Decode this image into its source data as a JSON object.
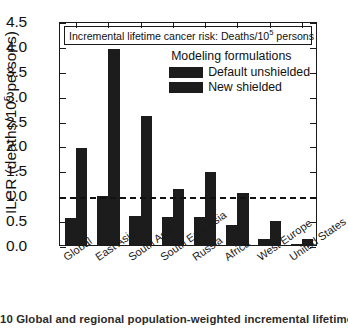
{
  "figure": {
    "caption": "10 Global and regional population-weighted incremental lifetime cancer"
  },
  "axis": {
    "y_title_main": "ILCR (deaths/10",
    "y_title_sup": "5",
    "y_title_tail": " persons)",
    "y_ticklabels": [
      "4.5",
      "4.0",
      "3.5",
      "3.0",
      "2.5",
      "2.0",
      "1.5",
      "1.0",
      "0.5",
      "0.0"
    ]
  },
  "title_box": {
    "text_main": "Incremental lifetime cancer risk: Deaths/10",
    "text_sup": "5",
    "text_tail": " persons"
  },
  "legend": {
    "title": "Modeling  formulations",
    "entries": [
      {
        "label": "Default unshielded",
        "color": "#1c1c1c"
      },
      {
        "label": "New shielded",
        "color": "#1c1c1c"
      }
    ]
  },
  "colors": {
    "bar": "#1c1c1c",
    "axis": "#1a1a1a",
    "threshold": "#111111"
  },
  "chart_data": {
    "type": "bar",
    "xlabel": "",
    "ylabel": "ILCR (deaths/10^5 persons)",
    "ylim": [
      0.0,
      4.5
    ],
    "ytick_step": 0.5,
    "grid": false,
    "legend_position": "top-right",
    "categories": [
      "Global",
      "East Asia",
      "South Asia",
      "South East Asia",
      "Russia",
      "Africa",
      "West Europe",
      "United States"
    ],
    "series": [
      {
        "name": "Default unshielded",
        "values": [
          0.54,
          0.98,
          0.58,
          0.57,
          0.57,
          0.4,
          0.12,
          0.02
        ]
      },
      {
        "name": "New shielded",
        "values": [
          1.95,
          3.93,
          2.59,
          1.12,
          1.46,
          1.05,
          0.48,
          0.12
        ]
      }
    ],
    "annotations": [
      {
        "type": "hline",
        "value": 1.0,
        "style": "dashed",
        "label": ""
      }
    ]
  }
}
